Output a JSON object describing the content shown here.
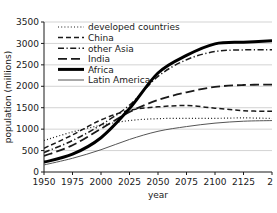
{
  "chart_data": {
    "type": "line",
    "title": "",
    "xlabel": "year",
    "ylabel": "population (millions)",
    "xlim": [
      1950,
      2150
    ],
    "ylim": [
      0,
      3500
    ],
    "xticks": [
      1950,
      1975,
      2000,
      2025,
      2050,
      2075,
      2100,
      2125,
      2150
    ],
    "xtick_labels": [
      "1950",
      "1975",
      "2000",
      "2025",
      "2050",
      "2075",
      "2100",
      "2125",
      "2"
    ],
    "yticks": [
      0,
      500,
      1000,
      1500,
      2000,
      2500,
      3000,
      3500
    ],
    "ytick_labels": [
      "0",
      "500",
      "1000",
      "1500",
      "2000",
      "2500",
      "3000",
      "3500"
    ],
    "grid": "horizontal",
    "legend_position": "top-left",
    "x": [
      1950,
      1975,
      2000,
      2025,
      2050,
      2075,
      2100,
      2125,
      2150
    ],
    "series": [
      {
        "name": "developed countries",
        "style": "dotted",
        "width": 1.2,
        "color": "#1a1a1a",
        "values": [
          735,
          935,
          1090,
          1200,
          1245,
          1250,
          1252,
          1262,
          1250
        ]
      },
      {
        "name": "China",
        "style": "dashed",
        "width": 1.5,
        "color": "#1a1a1a",
        "values": [
          555,
          865,
          1215,
          1440,
          1520,
          1550,
          1490,
          1430,
          1415
        ]
      },
      {
        "name": "other Asia",
        "style": "dash-dot",
        "width": 1.5,
        "color": "#1a1a1a",
        "values": [
          455,
          735,
          1100,
          1560,
          2230,
          2620,
          2810,
          2850,
          2855
        ]
      },
      {
        "name": "India",
        "style": "long-dash",
        "width": 1.8,
        "color": "#1a1a1a",
        "values": [
          375,
          625,
          1010,
          1400,
          1680,
          1860,
          1985,
          2030,
          2040
        ]
      },
      {
        "name": "Africa",
        "style": "solid",
        "width": 3.0,
        "color": "#000000",
        "values": [
          230,
          415,
          800,
          1480,
          2310,
          2720,
          2990,
          3030,
          3060
        ]
      },
      {
        "name": "Latin America",
        "style": "solid",
        "width": 1.0,
        "color": "#555555",
        "values": [
          165,
          320,
          520,
          760,
          950,
          1060,
          1140,
          1185,
          1200
        ]
      }
    ]
  },
  "legend": {
    "items": [
      {
        "label": "developed countries"
      },
      {
        "label": "China"
      },
      {
        "label": "other Asia"
      },
      {
        "label": "India"
      },
      {
        "label": "Africa"
      },
      {
        "label": "Latin America"
      }
    ]
  }
}
